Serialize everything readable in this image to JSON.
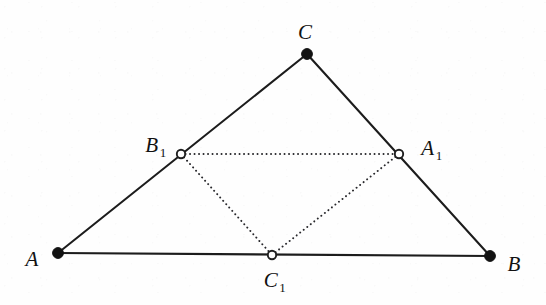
{
  "figure": {
    "canvas": {
      "width": 546,
      "height": 305,
      "background": "#fefefe"
    },
    "style": {
      "solid_stroke_color": "#1c1c1c",
      "solid_stroke_width": 2.1,
      "dotted_stroke_color": "#27272b",
      "dotted_stroke_width": 1.9,
      "filled_vertex_color": "#121212",
      "open_vertex_fill": "#ffffff",
      "open_vertex_stroke": "#1f1f1f"
    },
    "points": [
      {
        "id": "A",
        "label_main": "A",
        "label_sub": "",
        "x": 58,
        "y": 253,
        "marker": "filled",
        "radius": 5.4,
        "label_x": 32,
        "label_y": 259
      },
      {
        "id": "B",
        "label_main": "B",
        "label_sub": "",
        "x": 490,
        "y": 256,
        "marker": "filled",
        "radius": 5.4,
        "label_x": 514,
        "label_y": 264
      },
      {
        "id": "C",
        "label_main": "C",
        "label_sub": "",
        "x": 307,
        "y": 54,
        "marker": "filled",
        "radius": 5.4,
        "label_x": 305,
        "label_y": 32
      },
      {
        "id": "A1",
        "label_main": "A",
        "label_sub": "1",
        "x": 399,
        "y": 154,
        "marker": "open",
        "radius": 4.2,
        "label_x": 431,
        "label_y": 148
      },
      {
        "id": "B1",
        "label_main": "B",
        "label_sub": "1",
        "x": 181,
        "y": 154,
        "marker": "open",
        "radius": 4.2,
        "label_x": 155,
        "label_y": 145
      },
      {
        "id": "C1",
        "label_main": "C",
        "label_sub": "1",
        "x": 272,
        "y": 255,
        "marker": "open",
        "radius": 4.2,
        "label_x": 274,
        "label_y": 280
      }
    ],
    "edges_solid": [
      {
        "id": "edge-AB",
        "from": "A",
        "to": "B",
        "x1": 58,
        "y1": 253,
        "x2": 490,
        "y2": 256
      },
      {
        "id": "edge-AC",
        "from": "A",
        "to": "C",
        "x1": 58,
        "y1": 253,
        "x2": 307,
        "y2": 54
      },
      {
        "id": "edge-BC",
        "from": "B",
        "to": "C",
        "x1": 490,
        "y1": 256,
        "x2": 307,
        "y2": 54
      }
    ],
    "edges_dotted": [
      {
        "id": "edge-B1A1",
        "from": "B1",
        "to": "A1",
        "x1": 181,
        "y1": 154,
        "x2": 399,
        "y2": 154
      },
      {
        "id": "edge-B1C1",
        "from": "B1",
        "to": "C1",
        "x1": 181,
        "y1": 154,
        "x2": 272,
        "y2": 255
      },
      {
        "id": "edge-C1A1",
        "from": "C1",
        "to": "A1",
        "x1": 272,
        "y1": 255,
        "x2": 399,
        "y2": 154
      }
    ]
  }
}
